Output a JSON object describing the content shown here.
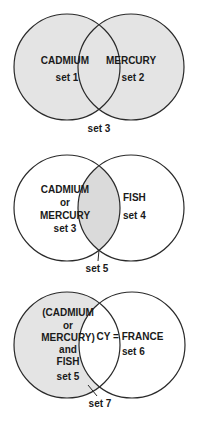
{
  "colors": {
    "shade": "#e4e4e4",
    "shade_dense": "#d9d9d9",
    "stroke": "#2a2a2a",
    "background": "#ffffff"
  },
  "diagrams": [
    {
      "title": "union",
      "left": {
        "lines": [
          "CADMIUM",
          "set 1"
        ]
      },
      "right": {
        "lines": [
          "MERCURY",
          "set 2"
        ]
      },
      "result_label": "set 3",
      "shaded": "both"
    },
    {
      "title": "intersection",
      "left": {
        "lines": [
          "CADMIUM",
          "or",
          "MERCURY",
          "set 3"
        ]
      },
      "right": {
        "lines": [
          "FISH",
          "set 4"
        ]
      },
      "result_label": "set 5",
      "shaded": "intersection"
    },
    {
      "title": "difference",
      "left": {
        "lines": [
          "(CADMIUM",
          "or",
          "MERCURY)",
          "and",
          "FISH",
          "set 5"
        ]
      },
      "right": {
        "lines": [
          "CY = FRANCE",
          "set 6"
        ]
      },
      "result_label": "set 7",
      "shaded": "left-only"
    }
  ]
}
